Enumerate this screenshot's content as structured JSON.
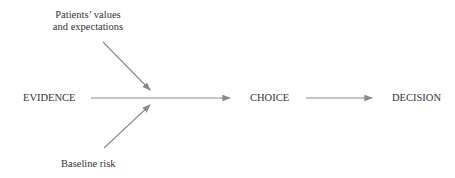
{
  "nodes": {
    "evidence": "EVIDENCE",
    "choice": "CHOICE",
    "decision": "DECISION",
    "values_line1": "Patients’ values",
    "values_line2": "and expectations",
    "baseline": "Baseline risk"
  },
  "colors": {
    "arrow": "#8a8a8a",
    "text": "#333333"
  }
}
